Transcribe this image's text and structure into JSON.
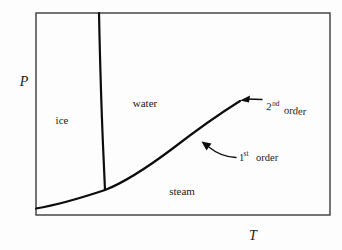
{
  "figure": {
    "kind": "phase-diagram",
    "background_color": "#fdfdfd",
    "line_color": "#0d0d0d",
    "frame_color": "#3a3a3a"
  },
  "axes": {
    "y_label": "P",
    "x_label": "T",
    "frame": {
      "left": 36,
      "top": 13,
      "right": 330,
      "bottom": 215
    }
  },
  "regions": [
    {
      "key": "ice",
      "label": "ice",
      "x": 62,
      "y": 124
    },
    {
      "key": "water",
      "label": "water",
      "x": 145,
      "y": 107
    },
    {
      "key": "steam",
      "label": "steam",
      "x": 182,
      "y": 195
    }
  ],
  "curves": {
    "fusion": {
      "name": "ice-water boundary",
      "points": [
        [
          99,
          13
        ],
        [
          101,
          80
        ],
        [
          103,
          140
        ],
        [
          105,
          190
        ]
      ]
    },
    "vaporization": {
      "name": "water-steam boundary",
      "points": [
        [
          36,
          208
        ],
        [
          70,
          201
        ],
        [
          105,
          190
        ],
        [
          140,
          172
        ],
        [
          170,
          152
        ],
        [
          200,
          128
        ],
        [
          222,
          113
        ],
        [
          240,
          101
        ]
      ]
    }
  },
  "annotations": [
    {
      "key": "second-order",
      "text_main": "order",
      "text_num": "2",
      "text_sup": "nd",
      "x": 264,
      "y": 110,
      "rotation": 5,
      "arrow": {
        "type": "straight",
        "from": [
          262,
          100
        ],
        "to": [
          243,
          99
        ]
      }
    },
    {
      "key": "first-order",
      "text_main": "order",
      "text_num": "1",
      "text_sup": "st",
      "x": 237,
      "y": 160,
      "rotation": 0,
      "arrow": {
        "type": "curved",
        "path": "M 234 157 C 222 155 214 152 205 145",
        "to": [
          201,
          142
        ]
      }
    }
  ]
}
